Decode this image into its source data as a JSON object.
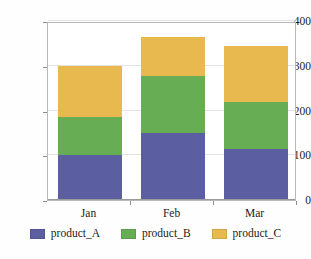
{
  "chart_data": {
    "type": "bar",
    "subtype": "stacked-bar",
    "title": "",
    "xlabel": "",
    "ylabel": "",
    "categories": [
      "Jan",
      "Feb",
      "Mar"
    ],
    "series": [
      {
        "name": "product_A",
        "color": "#5b5ea1",
        "values": [
          100,
          150,
          115
        ]
      },
      {
        "name": "product_B",
        "color": "#67ad54",
        "values": [
          85,
          128,
          105
        ]
      },
      {
        "name": "product_C",
        "color": "#e8b94e",
        "values": [
          115,
          87,
          125
        ]
      }
    ],
    "totals": [
      300,
      365,
      345
    ],
    "ylim": [
      0,
      400
    ],
    "yticks": [
      0,
      100,
      200,
      300,
      400
    ],
    "ytick_labels": [
      "0",
      "100",
      "200",
      "300",
      "400"
    ],
    "grid": true,
    "legend_position": "bottom",
    "plot_border": true
  },
  "axes": {
    "y_tick_labels": [
      "400",
      "300",
      "200",
      "100",
      "0"
    ],
    "x_tick_labels": [
      "Jan",
      "Feb",
      "Mar"
    ]
  },
  "legend": {
    "items": [
      {
        "label": "product_A",
        "color": "#5b5ea1"
      },
      {
        "label": "product_B",
        "color": "#67ad54"
      },
      {
        "label": "product_C",
        "color": "#e8b94e"
      }
    ]
  }
}
